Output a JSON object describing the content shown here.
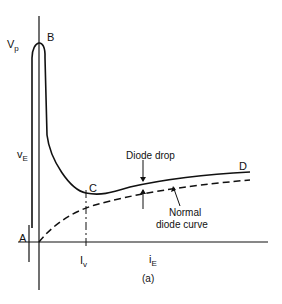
{
  "figure": {
    "caption": "(a)",
    "labels": {
      "vp": "V",
      "vp_sub": "p",
      "b": "B",
      "ve": "v",
      "ve_sub": "E",
      "a": "A",
      "c": "C",
      "d": "D",
      "iv": "I",
      "iv_sub": "v",
      "ie": "i",
      "ie_sub": "E",
      "diode_drop": "Diode drop",
      "normal_line1": "Normal",
      "normal_line2": "diode curve"
    },
    "colors": {
      "ink": "#111111",
      "background": "#ffffff"
    }
  }
}
